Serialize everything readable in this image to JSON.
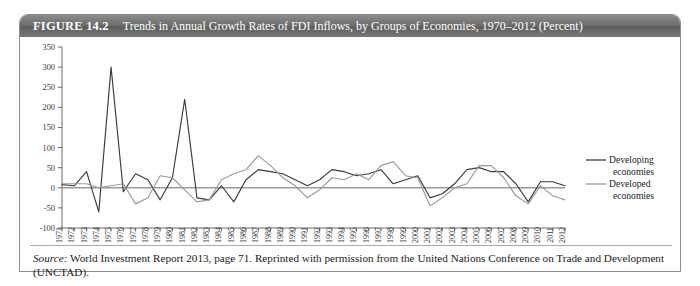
{
  "figure": {
    "label": "FIGURE 14.2",
    "title": "Trends in Annual Growth Rates of FDI Inflows, by Groups of Economies, 1970–2012 (Percent)"
  },
  "source": {
    "word": "Source:",
    "text": " World Investment Report 2013, page 71. Reprinted with permission  from the United Nations Conference on Trade and Development (UNCTAD)."
  },
  "colors": {
    "developing": "#3b3b3b",
    "developed": "#9a9a9a",
    "axis": "#6b6b6b",
    "zero_line": "#9a9a9a",
    "header_bg": "#6f6f6f",
    "frame": "#8e8e8e"
  },
  "chart_data": {
    "type": "line",
    "title": "Trends in Annual Growth Rates of FDI Inflows, by Groups of Economies, 1970–2012 (Percent)",
    "xlabel": "",
    "ylabel": "",
    "ylim": [
      -100,
      350
    ],
    "yticks": [
      350,
      300,
      250,
      200,
      150,
      100,
      50,
      0,
      -50,
      -100
    ],
    "grid": false,
    "legend_position": "right",
    "x": [
      1971,
      1972,
      1973,
      1974,
      1975,
      1976,
      1977,
      1978,
      1979,
      1980,
      1981,
      1982,
      1983,
      1984,
      1985,
      1986,
      1987,
      1988,
      1989,
      1990,
      1991,
      1992,
      1993,
      1994,
      1995,
      1996,
      1997,
      1998,
      1999,
      2000,
      2001,
      2002,
      2003,
      2004,
      2005,
      2006,
      2007,
      2008,
      2009,
      2010,
      2011,
      2012
    ],
    "categories": [
      "1971",
      "1972",
      "1973",
      "1974",
      "1975",
      "1976",
      "1977",
      "1978",
      "1979",
      "1980",
      "1981",
      "1982",
      "1983",
      "1984",
      "1985",
      "1986",
      "1987",
      "1988",
      "1989",
      "1990",
      "1991",
      "1992",
      "1993",
      "1994",
      "1995",
      "1996",
      "1997",
      "1998",
      "1999",
      "2000",
      "2001",
      "2002",
      "2003",
      "2004",
      "2005",
      "2006",
      "2007",
      "2008",
      "2009",
      "2010",
      "2011",
      "2012"
    ],
    "series": [
      {
        "name": "Developing economies",
        "color": "#3b3b3b",
        "values": [
          8,
          5,
          40,
          -60,
          300,
          -10,
          35,
          20,
          -30,
          25,
          220,
          -25,
          -30,
          5,
          -35,
          20,
          45,
          40,
          35,
          20,
          5,
          20,
          45,
          40,
          30,
          35,
          45,
          10,
          20,
          30,
          -25,
          -15,
          10,
          45,
          50,
          40,
          40,
          10,
          -35,
          15,
          15,
          5
        ]
      },
      {
        "name": "Developed economies",
        "color": "#9a9a9a",
        "values": [
          10,
          10,
          10,
          0,
          5,
          10,
          -40,
          -25,
          30,
          25,
          -5,
          -35,
          -30,
          20,
          35,
          45,
          80,
          55,
          25,
          5,
          -25,
          -5,
          25,
          20,
          35,
          20,
          55,
          65,
          30,
          25,
          -45,
          -25,
          0,
          10,
          55,
          55,
          25,
          -20,
          -40,
          5,
          -20,
          -30
        ]
      }
    ]
  }
}
